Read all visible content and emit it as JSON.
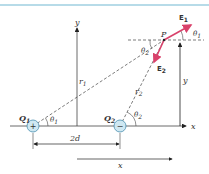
{
  "diagram": {
    "colors": {
      "top_rule": "#9fcfe0",
      "axis": "#444444",
      "field_vector": "#d9426b",
      "charge_fill": "#cfe8f2",
      "charge_stroke": "#4a8fb0"
    },
    "charges": [
      {
        "label": "Q",
        "sub": "1",
        "sign": "+"
      },
      {
        "label": "Q",
        "sub": "2",
        "sign": "−"
      }
    ],
    "point": {
      "label": "P"
    },
    "vectors": [
      {
        "label": "E",
        "sub": "1"
      },
      {
        "label": "E",
        "sub": "2"
      }
    ],
    "distances": [
      {
        "label": "r",
        "sub": "1"
      },
      {
        "label": "r",
        "sub": "2"
      }
    ],
    "angles": {
      "theta1_q1": {
        "label": "θ",
        "sub": "1"
      },
      "theta2_q2": {
        "label": "θ",
        "sub": "2"
      },
      "theta2_p": {
        "label": "θ",
        "sub": "2"
      },
      "theta1_p": {
        "label": "θ",
        "sub": "1"
      }
    },
    "axes": {
      "x_label": "x",
      "y_label": "y",
      "y_height_label": "y",
      "x_distance_label": "x"
    },
    "separation_label": "2d"
  }
}
